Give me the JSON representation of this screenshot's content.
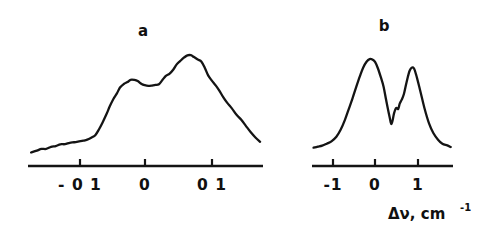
{
  "figure": {
    "background_color": "#ffffff",
    "ink_color": "#141414",
    "axis_title": "Δν, cm",
    "axis_title_exponent": "-1"
  },
  "chart_data": [
    {
      "type": "line",
      "panel": "a",
      "title": "a",
      "xlabel": "Δν, cm^-1",
      "ylabel": "",
      "grid": false,
      "legend": null,
      "xticks": [
        -0.1,
        0,
        0.1
      ],
      "xtick_labels": [
        "- 0 1",
        "0",
        "0 1"
      ],
      "xlim": [
        -0.22,
        0.18
      ],
      "ylim": [
        0,
        1.05
      ],
      "description": "Asymmetric doublet spectral line profile with a shallow central dip; right peak higher than left peak.",
      "x": [
        -0.215,
        -0.205,
        -0.197,
        -0.189,
        -0.181,
        -0.173,
        -0.165,
        -0.157,
        -0.149,
        -0.141,
        -0.133,
        -0.126,
        -0.119,
        -0.112,
        -0.105,
        -0.099,
        -0.093,
        -0.087,
        -0.081,
        -0.075,
        -0.069,
        -0.063,
        -0.057,
        -0.051,
        -0.045,
        -0.039,
        -0.033,
        -0.027,
        -0.021,
        -0.015,
        -0.009,
        -0.003,
        0.003,
        0.009,
        0.015,
        0.021,
        0.027,
        0.033,
        0.039,
        0.045,
        0.051,
        0.057,
        0.063,
        0.069,
        0.075,
        0.081,
        0.087,
        0.093,
        0.099,
        0.105,
        0.112,
        0.119,
        0.127,
        0.135,
        0.143,
        0.151,
        0.159,
        0.167,
        0.175
      ],
      "y": [
        0.075,
        0.085,
        0.1,
        0.105,
        0.118,
        0.126,
        0.14,
        0.145,
        0.155,
        0.162,
        0.17,
        0.175,
        0.185,
        0.2,
        0.225,
        0.27,
        0.33,
        0.4,
        0.47,
        0.53,
        0.58,
        0.625,
        0.655,
        0.675,
        0.69,
        0.695,
        0.685,
        0.66,
        0.645,
        0.64,
        0.645,
        0.65,
        0.655,
        0.69,
        0.725,
        0.75,
        0.785,
        0.82,
        0.855,
        0.88,
        0.9,
        0.905,
        0.885,
        0.87,
        0.85,
        0.79,
        0.73,
        0.69,
        0.645,
        0.6,
        0.55,
        0.5,
        0.45,
        0.4,
        0.35,
        0.3,
        0.245,
        0.2,
        0.165
      ]
    },
    {
      "type": "line",
      "panel": "b",
      "title": "b",
      "xlabel": "Δν, cm^-1",
      "ylabel": "",
      "grid": false,
      "legend": null,
      "xticks": [
        -1,
        0,
        1
      ],
      "xtick_labels": [
        "-1",
        "0",
        "1"
      ],
      "xlim": [
        -1.75,
        1.35
      ],
      "ylim": [
        0,
        1.05
      ],
      "description": "Resolved doublet spectral line profile with a deep V-shaped central minimum; left peak slightly higher than right peak, small shoulder step on right flank of the valley.",
      "x": [
        -1.72,
        -1.62,
        -1.52,
        -1.42,
        -1.32,
        -1.22,
        -1.12,
        -1.02,
        -0.94,
        -0.86,
        -0.78,
        -0.7,
        -0.62,
        -0.55,
        -0.48,
        -0.42,
        -0.36,
        -0.3,
        -0.24,
        -0.18,
        -0.12,
        -0.06,
        0.0,
        0.05,
        0.1,
        0.14,
        0.18,
        0.22,
        0.27,
        0.33,
        0.4,
        0.47,
        0.54,
        0.62,
        0.72,
        0.82,
        0.92,
        1.02,
        1.12,
        1.22,
        1.3
      ],
      "y": [
        0.065,
        0.075,
        0.085,
        0.1,
        0.125,
        0.165,
        0.23,
        0.32,
        0.42,
        0.52,
        0.62,
        0.72,
        0.8,
        0.855,
        0.875,
        0.87,
        0.845,
        0.79,
        0.71,
        0.62,
        0.5,
        0.37,
        0.285,
        0.38,
        0.43,
        0.42,
        0.47,
        0.5,
        0.56,
        0.66,
        0.77,
        0.8,
        0.74,
        0.6,
        0.43,
        0.29,
        0.2,
        0.14,
        0.105,
        0.085,
        0.075
      ]
    }
  ],
  "panels": {
    "a": {
      "label": "a",
      "tick_labels": [
        "- 0 1",
        "0",
        "0 1"
      ]
    },
    "b": {
      "label": "b",
      "tick_labels": [
        "-1",
        "0",
        "1"
      ]
    }
  }
}
